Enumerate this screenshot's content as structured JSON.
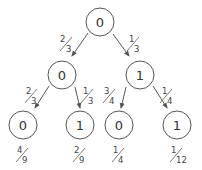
{
  "diagram": {
    "type": "probability-tree",
    "colors": {
      "stroke": "#555555",
      "text": "#333333",
      "background": "#ffffff"
    },
    "nodes": [
      {
        "id": "root",
        "label": "0",
        "cx": 100,
        "cy": 22
      },
      {
        "id": "mid-left",
        "label": "0",
        "cx": 62,
        "cy": 75
      },
      {
        "id": "mid-right",
        "label": "1",
        "cx": 140,
        "cy": 75
      },
      {
        "id": "leaf-1",
        "label": "0",
        "cx": 23,
        "cy": 125
      },
      {
        "id": "leaf-2",
        "label": "1",
        "cx": 80,
        "cy": 125
      },
      {
        "id": "leaf-3",
        "label": "0",
        "cx": 119,
        "cy": 125
      },
      {
        "id": "leaf-4",
        "label": "1",
        "cx": 177,
        "cy": 125
      }
    ],
    "edges": [
      {
        "from": "root",
        "to": "mid-left",
        "prob_num": "2",
        "prob_den": "3"
      },
      {
        "from": "root",
        "to": "mid-right",
        "prob_num": "1",
        "prob_den": "3"
      },
      {
        "from": "mid-left",
        "to": "leaf-1",
        "prob_num": "2",
        "prob_den": "3"
      },
      {
        "from": "mid-left",
        "to": "leaf-2",
        "prob_num": "1",
        "prob_den": "3"
      },
      {
        "from": "mid-right",
        "to": "leaf-3",
        "prob_num": "3",
        "prob_den": "4"
      },
      {
        "from": "mid-right",
        "to": "leaf-4",
        "prob_num": "1",
        "prob_den": "4"
      }
    ],
    "leaf_probabilities": [
      {
        "leaf": "leaf-1",
        "num": "4",
        "den": "9"
      },
      {
        "leaf": "leaf-2",
        "num": "2",
        "den": "9"
      },
      {
        "leaf": "leaf-3",
        "num": "1",
        "den": "4"
      },
      {
        "leaf": "leaf-4",
        "num": "1",
        "den": "12"
      }
    ]
  }
}
